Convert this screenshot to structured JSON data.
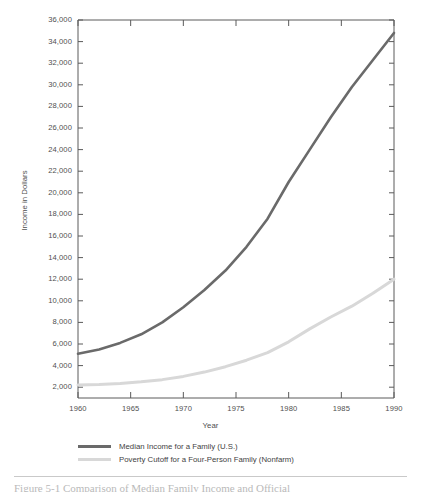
{
  "chart_data": {
    "type": "line",
    "title": "",
    "xlabel": "Year",
    "ylabel": "Income in Dollars",
    "xlim": [
      1960,
      1990
    ],
    "ylim": [
      1000,
      36000
    ],
    "grid": false,
    "legend_position": "below",
    "x_ticks": [
      "1960",
      "1965",
      "1970",
      "1975",
      "1980",
      "1985",
      "1990"
    ],
    "x_tick_values": [
      1960,
      1965,
      1970,
      1975,
      1980,
      1985,
      1990
    ],
    "y_ticks": [
      "2,000",
      "4,000",
      "6,000",
      "8,000",
      "10,000",
      "12,000",
      "14,000",
      "16,000",
      "18,000",
      "20,000",
      "22,000",
      "24,000",
      "26,000",
      "28,000",
      "30,000",
      "32,000",
      "34,000",
      "36,000"
    ],
    "y_tick_values": [
      2000,
      4000,
      6000,
      8000,
      10000,
      12000,
      14000,
      16000,
      18000,
      20000,
      22000,
      24000,
      26000,
      28000,
      30000,
      32000,
      34000,
      36000
    ],
    "x": [
      1960,
      1962,
      1964,
      1966,
      1968,
      1970,
      1972,
      1974,
      1976,
      1978,
      1980,
      1982,
      1984,
      1986,
      1988,
      1990
    ],
    "series": [
      {
        "name": "Median Income for a Family (U.S.)",
        "color": "#6a6a6a",
        "values": [
          5100,
          5500,
          6100,
          6900,
          8000,
          9400,
          11000,
          12800,
          15000,
          17600,
          21000,
          24000,
          27000,
          29800,
          32300,
          34800
        ]
      },
      {
        "name": "Poverty Cutoff for a Four-Person Family (Nonfarm)",
        "color": "#d8d8d8",
        "values": [
          2200,
          2250,
          2350,
          2500,
          2700,
          3000,
          3400,
          3900,
          4500,
          5200,
          6200,
          7400,
          8500,
          9500,
          10700,
          12000
        ]
      }
    ]
  },
  "axis": {
    "x_title": "Year",
    "y_title": "Income in Dollars"
  },
  "legend": {
    "items": [
      {
        "label": "Median Income for a Family (U.S.)",
        "color": "#6a6a6a"
      },
      {
        "label": "Poverty Cutoff for a Four-Person Family (Nonfarm)",
        "color": "#d8d8d8"
      }
    ]
  },
  "caption": {
    "figure_number": "Figure 5-1",
    "text": "Figure 5-1   Comparison of Median Family Income and Official"
  },
  "colors": {
    "series_dark": "#6a6a6a",
    "series_light": "#d8d8d8",
    "axis": "#5a5a5a",
    "text": "#4f4f4f",
    "background": "#ffffff"
  }
}
